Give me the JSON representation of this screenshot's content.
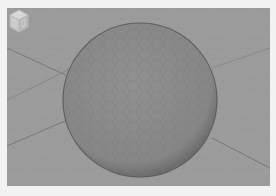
{
  "viewport": {
    "background": "#9c9c9c",
    "grid_color": "#8e8e8e",
    "horizon_line_color": "#6f6f6f",
    "object": {
      "type": "sphere",
      "fill": "#8a8a8a",
      "edge": "#5e5e5e",
      "mesh": "hexagonal"
    }
  },
  "view_cube": {
    "icon": "view-cube-icon"
  }
}
